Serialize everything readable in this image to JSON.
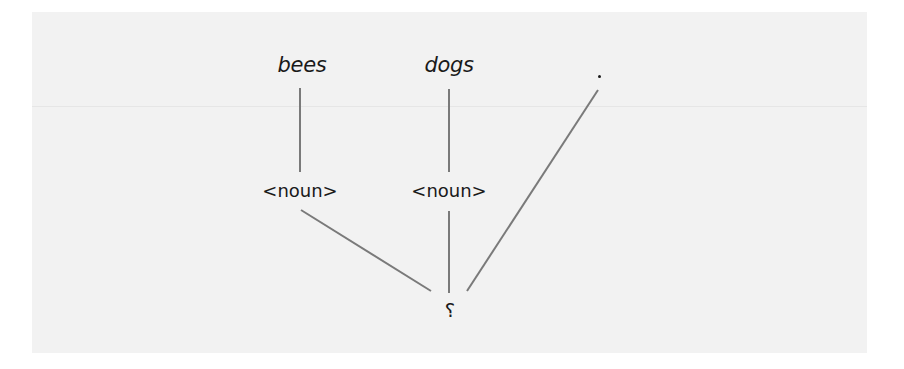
{
  "diagram": {
    "type": "parse-tree",
    "colors": {
      "background": "#ffffff",
      "panel": "#f2f2f2",
      "edge": "#7a7a7a",
      "text": "#1a1a1a"
    },
    "leaves": [
      {
        "id": "bees",
        "label": "bees"
      },
      {
        "id": "dogs",
        "label": "dogs"
      },
      {
        "id": "period",
        "label": "."
      }
    ],
    "intermediate": [
      {
        "id": "noun1",
        "label": "<noun>"
      },
      {
        "id": "noun2",
        "label": "<noun>"
      }
    ],
    "root": {
      "id": "root",
      "label": "?"
    },
    "edges": [
      {
        "from": "bees",
        "to": "noun1"
      },
      {
        "from": "dogs",
        "to": "noun2"
      },
      {
        "from": "noun1",
        "to": "root"
      },
      {
        "from": "noun2",
        "to": "root"
      },
      {
        "from": "period",
        "to": "root"
      }
    ]
  }
}
